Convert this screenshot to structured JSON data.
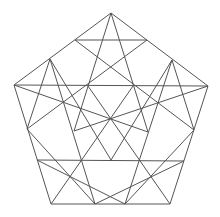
{
  "diagram": {
    "title": "",
    "outer_pentagon": [
      [
        111,
        13
      ],
      [
        208,
        86
      ],
      [
        170,
        204
      ],
      [
        51,
        204
      ],
      [
        14,
        85
      ]
    ],
    "lines": [
      [
        [
          14,
          85
        ],
        [
          208,
          86
        ]
      ],
      [
        [
          75,
          40
        ],
        [
          147,
          40
        ]
      ],
      [
        [
          75,
          40
        ],
        [
          194,
          130
        ]
      ],
      [
        [
          147,
          40
        ],
        [
          27,
          129
        ]
      ],
      [
        [
          111,
          13
        ],
        [
          74,
          131
        ]
      ],
      [
        [
          111,
          13
        ],
        [
          148,
          132
        ]
      ],
      [
        [
          50,
          59
        ],
        [
          95,
          204
        ]
      ],
      [
        [
          50,
          59
        ],
        [
          27,
          129
        ]
      ],
      [
        [
          172,
          60
        ],
        [
          194,
          130
        ]
      ],
      [
        [
          172,
          60
        ],
        [
          125,
          204
        ]
      ],
      [
        [
          14,
          85
        ],
        [
          148,
          132
        ]
      ],
      [
        [
          208,
          86
        ],
        [
          74,
          131
        ]
      ],
      [
        [
          37,
          160
        ],
        [
          184,
          161
        ]
      ],
      [
        [
          37,
          160
        ],
        [
          125,
          204
        ]
      ],
      [
        [
          184,
          161
        ],
        [
          95,
          204
        ]
      ],
      [
        [
          51,
          204
        ],
        [
          133,
          86
        ]
      ],
      [
        [
          170,
          204
        ],
        [
          88,
          86
        ]
      ],
      [
        [
          50,
          59
        ],
        [
          111,
          160
        ]
      ],
      [
        [
          172,
          60
        ],
        [
          111,
          160
        ]
      ],
      [
        [
          27,
          129
        ],
        [
          95,
          204
        ]
      ],
      [
        [
          194,
          130
        ],
        [
          125,
          204
        ]
      ]
    ],
    "stroke_color": "#555555"
  }
}
